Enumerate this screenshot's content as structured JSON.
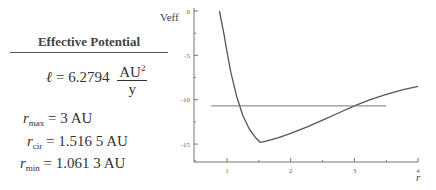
{
  "panel": {
    "title": "Effective Potential",
    "ell": {
      "symbol": "ℓ",
      "equals": "= 6.2794",
      "unit_num": "AU",
      "unit_sup": "2",
      "unit_den": "y"
    },
    "rmax": {
      "symbol": "r",
      "sub": "max",
      "value": "= 3 AU"
    },
    "rcir": {
      "symbol": "r",
      "sub": "cir",
      "value": "= 1.516 5 AU"
    },
    "rmin": {
      "symbol": "r",
      "sub": "min",
      "value": "= 1.061 3 AU"
    }
  },
  "chart_data": {
    "type": "line",
    "title": "",
    "xlabel": "r",
    "ylabel": "Veff",
    "xlim": [
      0.48,
      4.0
    ],
    "ylim": [
      -16.5,
      0
    ],
    "x_ticks": [
      "1",
      "2",
      "3",
      "4"
    ],
    "y_ticks": [
      "0",
      "-5",
      "-10",
      "-15"
    ],
    "grid": false,
    "series": [
      {
        "name": "Veff",
        "x": [
          0.88,
          0.95,
          1.0,
          1.06,
          1.15,
          1.25,
          1.35,
          1.45,
          1.52,
          1.6,
          1.8,
          2.0,
          2.25,
          2.5,
          2.75,
          3.0,
          3.25,
          3.5,
          3.75,
          4.0
        ],
        "values": [
          0.0,
          -2.5,
          -4.6,
          -6.9,
          -9.6,
          -11.8,
          -13.3,
          -14.3,
          -14.8,
          -14.7,
          -14.3,
          -13.8,
          -13.1,
          -12.3,
          -11.5,
          -10.7,
          -10.0,
          -9.4,
          -8.9,
          -8.5
        ]
      },
      {
        "name": "Energy",
        "x": [
          0.75,
          3.5
        ],
        "values": [
          -10.7,
          -10.7
        ]
      }
    ]
  }
}
